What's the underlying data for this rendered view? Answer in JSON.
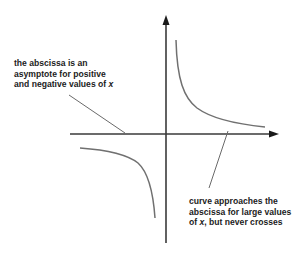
{
  "diagram": {
    "type": "hyperbola-asymptote",
    "axes": {
      "vertical": {
        "x": 166,
        "y_top": 16,
        "y_bottom": 243,
        "arrow": "up"
      },
      "horizontal": {
        "y": 134,
        "x_left": 70,
        "x_right": 278,
        "arrow": "right"
      }
    },
    "annotations": {
      "left": {
        "lines": [
          "the abscissa is an",
          "asymptote for positive",
          "and negative values of "
        ],
        "italic_tail": "x"
      },
      "right": {
        "lines": [
          "curve approaches the",
          "abscissa for large values",
          "of "
        ],
        "italic_mid": "x",
        "tail": ", but never crosses"
      }
    },
    "colors": {
      "axis": "#3a3a3a",
      "curve": "#707070",
      "pointer": "#6a6a6a",
      "text": "#1c1c1c",
      "background": "#ffffff"
    }
  }
}
